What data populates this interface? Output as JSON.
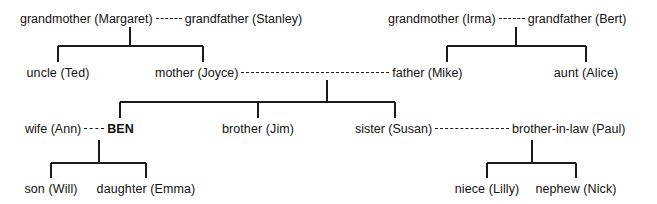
{
  "diagram": {
    "line_color": "#1a1a1a",
    "text_color": "#111111",
    "background": "#ffffff"
  },
  "people": {
    "grandmother_margaret": "grandmother (Margaret)",
    "grandfather_stanley": "grandfather (Stanley)",
    "grandmother_irma": "grandmother (Irma)",
    "grandfather_bert": "grandfather (Bert)",
    "uncle_ted": "uncle (Ted)",
    "mother_joyce": "mother (Joyce)",
    "father_mike": "father (Mike)",
    "aunt_alice": "aunt (Alice)",
    "wife_ann": "wife (Ann)",
    "ben": "BEN",
    "brother_jim": "brother (Jim)",
    "sister_susan": "sister (Susan)",
    "brother_in_law_paul": "brother-in-law (Paul)",
    "son_will": "son (Will)",
    "daughter_emma": "daughter (Emma)",
    "niece_lilly": "niece (Lilly)",
    "nephew_nick": "nephew (Nick)"
  },
  "rows": [
    {
      "name": "grandparents",
      "couples": [
        {
          "left": "grandmother (Margaret)",
          "right": "grandfather (Stanley)"
        },
        {
          "left": "grandmother (Irma)",
          "right": "grandfather (Bert)"
        }
      ]
    },
    {
      "name": "parents",
      "members": [
        "uncle (Ted)",
        "mother (Joyce)",
        "father (Mike)",
        "aunt (Alice)"
      ]
    },
    {
      "name": "self-and-siblings",
      "members": [
        "wife (Ann)",
        "BEN",
        "brother (Jim)",
        "sister (Susan)",
        "brother-in-law (Paul)"
      ]
    },
    {
      "name": "children",
      "members": [
        "son (Will)",
        "daughter (Emma)",
        "niece (Lilly)",
        "nephew (Nick)"
      ]
    }
  ]
}
